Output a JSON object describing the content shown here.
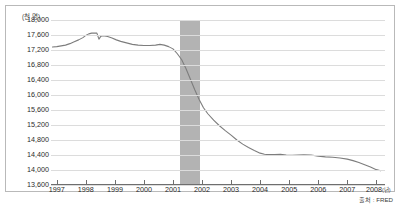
{
  "chart_data": {
    "type": "line",
    "title": "",
    "subtitle": "",
    "unit_label": "(천 명)",
    "xlabel": "",
    "ylabel": "",
    "year_unit_suffix": "(년)",
    "source": "출처 : FRED",
    "grid": true,
    "legend": null,
    "xlim": [
      1996.8,
      2008.3
    ],
    "ylim": [
      13600,
      18000
    ],
    "ytick_step": 400,
    "yticks": [
      13600,
      14000,
      14400,
      14800,
      15200,
      15600,
      16000,
      16400,
      16800,
      17200,
      17600,
      18000
    ],
    "ytick_labels": [
      "13,600",
      "14,000",
      "14,400",
      "14,800",
      "15,200",
      "15,600",
      "16,000",
      "16,400",
      "16,800",
      "17,200",
      "17,600",
      "18,000"
    ],
    "xticks": [
      1997,
      1998,
      1999,
      2000,
      2001,
      2002,
      2003,
      2004,
      2005,
      2006,
      2007,
      2008
    ],
    "xtick_labels": [
      "1997",
      "1998",
      "1999",
      "2000",
      "2001",
      "2002",
      "2003",
      "2004",
      "2005",
      "2006",
      "2007",
      "2008"
    ],
    "shaded_regions": [
      {
        "label": "recession",
        "x_start": 2001.25,
        "x_end": 2001.92,
        "color": "#b3b3b3"
      }
    ],
    "series": [
      {
        "name": "employment",
        "color": "#7d7d7d",
        "x": [
          1996.85,
          1997.0,
          1997.15,
          1997.3,
          1997.45,
          1997.6,
          1997.75,
          1997.9,
          1998.0,
          1998.1,
          1998.2,
          1998.3,
          1998.38,
          1998.45,
          1998.52,
          1998.6,
          1998.75,
          1998.9,
          1999.05,
          1999.2,
          1999.4,
          1999.6,
          1999.8,
          2000.0,
          2000.2,
          2000.4,
          2000.55,
          2000.7,
          2000.85,
          2001.0,
          2001.15,
          2001.3,
          2001.45,
          2001.6,
          2001.75,
          2001.9,
          2002.05,
          2002.2,
          2002.4,
          2002.6,
          2002.8,
          2003.0,
          2003.2,
          2003.4,
          2003.6,
          2003.8,
          2004.0,
          2004.15,
          2004.3,
          2004.5,
          2004.7,
          2004.9,
          2005.1,
          2005.3,
          2005.5,
          2005.75,
          2006.0,
          2006.25,
          2006.5,
          2006.75,
          2007.0,
          2007.2,
          2007.4,
          2007.6,
          2007.8,
          2008.0,
          2008.15
        ],
        "y": [
          17280,
          17290,
          17310,
          17330,
          17370,
          17420,
          17470,
          17530,
          17590,
          17630,
          17650,
          17655,
          17650,
          17490,
          17570,
          17580,
          17560,
          17520,
          17470,
          17430,
          17390,
          17350,
          17330,
          17320,
          17320,
          17330,
          17350,
          17330,
          17290,
          17230,
          17100,
          16940,
          16700,
          16420,
          16140,
          15880,
          15660,
          15500,
          15330,
          15180,
          15050,
          14930,
          14800,
          14690,
          14600,
          14520,
          14450,
          14420,
          14410,
          14415,
          14420,
          14400,
          14390,
          14400,
          14405,
          14400,
          14370,
          14350,
          14340,
          14320,
          14290,
          14250,
          14200,
          14140,
          14080,
          14010,
          13980
        ]
      }
    ]
  }
}
